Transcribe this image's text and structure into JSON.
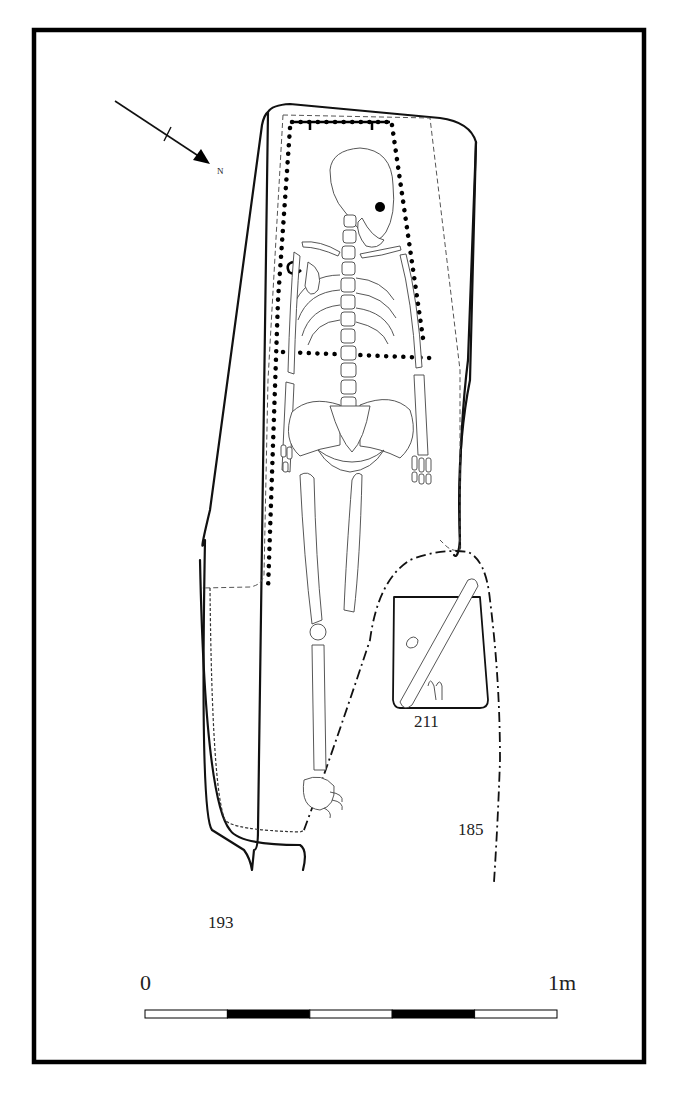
{
  "figure": {
    "type": "archaeological grave plan",
    "north_arrow": {
      "label": "N"
    },
    "context_labels": [
      {
        "id": "cut-193",
        "text": "193"
      },
      {
        "id": "cut-185",
        "text": "185"
      },
      {
        "id": "cut-211",
        "text": "211"
      }
    ],
    "scale_bar": {
      "start_label": "0",
      "end_label": "1m",
      "segments": 5,
      "segment_fills": [
        "white",
        "black",
        "white",
        "black",
        "white"
      ]
    },
    "colors": {
      "ink": "#000000",
      "bone_line": "#444444",
      "background": "#ffffff"
    }
  }
}
